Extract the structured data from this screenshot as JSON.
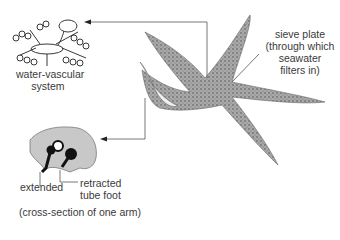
{
  "labels": {
    "water_vascular_line1": "water-vascular",
    "water_vascular_line2": "system",
    "sieve_plate_line1": "sieve plate",
    "sieve_plate_line2": "(through which",
    "sieve_plate_line3": "seawater",
    "sieve_plate_line4": "filters in)",
    "extended": "extended",
    "retracted_line1": "retracted",
    "retracted_line2": "tube foot",
    "caption": "(cross-section of one arm)"
  },
  "colors": {
    "starfish": "#8a8a8a",
    "cross_section_fill": "#c8c8c8",
    "line": "#555555",
    "ink": "#111111"
  }
}
